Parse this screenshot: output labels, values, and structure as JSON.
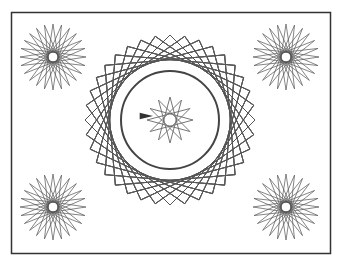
{
  "canvas": {
    "width": 341,
    "height": 270,
    "background": "#ffffff",
    "frame": {
      "x": 11.5,
      "y": 12.5,
      "width": 319,
      "height": 241,
      "stroke": "#333333",
      "stroke_width": 1.5
    }
  },
  "colors": {
    "line": "#555555",
    "star_line": "#666666",
    "ring": "#444444",
    "turtle": "#333333"
  },
  "center_figure": {
    "cx": 170,
    "cy": 120,
    "rotated_squares": {
      "count": 36,
      "circumradius": 85,
      "rotation_step_deg": 10
    },
    "ring": {
      "r": 49,
      "stroke_width": 2
    },
    "inner_star": {
      "points": 12,
      "skip": 5,
      "radius": 23
    },
    "inner_hole_r": 6
  },
  "corner_stars": [
    {
      "name": "top-left",
      "cx": 53,
      "cy": 57,
      "rays": 24,
      "radius": 33,
      "hole_r": 5
    },
    {
      "name": "top-right",
      "cx": 286,
      "cy": 57,
      "rays": 24,
      "radius": 33,
      "hole_r": 5
    },
    {
      "name": "bottom-left",
      "cx": 53,
      "cy": 207,
      "rays": 24,
      "radius": 33,
      "hole_r": 5
    },
    {
      "name": "bottom-right",
      "cx": 286,
      "cy": 207,
      "rays": 24,
      "radius": 33,
      "hole_r": 5
    }
  ],
  "turtle": {
    "x": 144,
    "y": 116,
    "heading_deg": 0,
    "size": 9
  }
}
